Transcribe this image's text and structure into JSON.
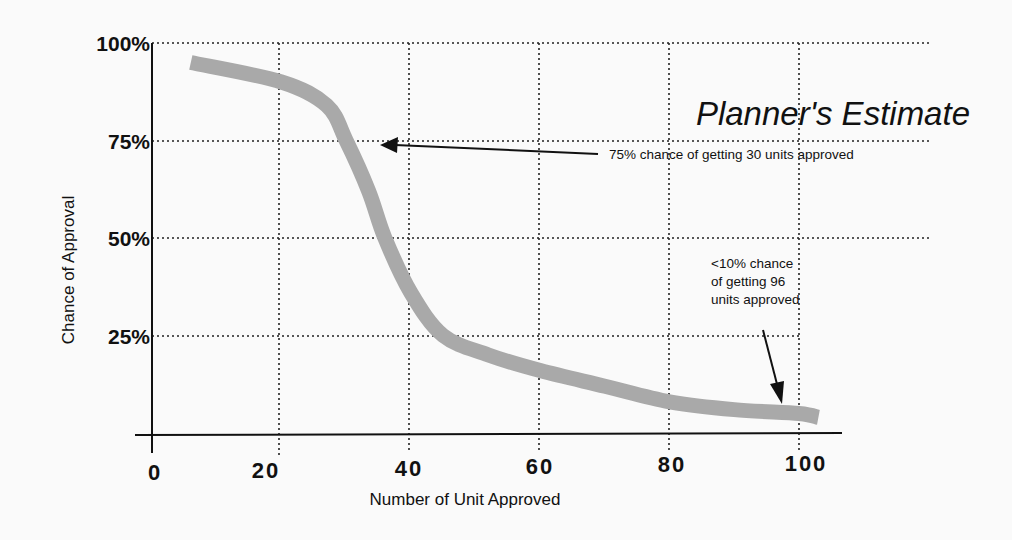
{
  "chart_data": {
    "type": "line",
    "title": "Planner's Estimate",
    "xlabel": "Number of Unit Approved",
    "ylabel": "Chance of Approval",
    "xlim": [
      0,
      100
    ],
    "ylim": [
      0,
      100
    ],
    "x_ticks": [
      0,
      20,
      40,
      60,
      80,
      100
    ],
    "x_tick_labels": [
      "0",
      "20",
      "40",
      "60",
      "80",
      "100"
    ],
    "y_ticks": [
      25,
      50,
      75,
      100
    ],
    "y_tick_labels": [
      "25%",
      "50%",
      "75%",
      "100%"
    ],
    "grid": true,
    "grid_style": "dotted",
    "legend": null,
    "series": [
      {
        "name": "Planner's Estimate",
        "color": "#a9a9a9",
        "x": [
          6,
          20,
          27,
          30,
          33.5,
          36,
          40,
          45,
          52,
          60,
          70,
          80,
          90,
          100,
          103
        ],
        "y": [
          95,
          90,
          84,
          75,
          62,
          50,
          36,
          25,
          20,
          16,
          12,
          8,
          6,
          5,
          4
        ]
      }
    ],
    "annotations": [
      {
        "text": "75% chance of getting 30 units approved",
        "point": [
          30,
          75
        ]
      },
      {
        "text": "<10% chance of getting 96 units approved",
        "point": [
          96,
          7
        ]
      }
    ]
  },
  "labels": {
    "title": "Planner's Estimate",
    "xlabel": "Number of Unit Approved",
    "ylabel": "Chance of Approval",
    "y_ticks": [
      "100%",
      "75%",
      "50%",
      "25%"
    ],
    "x_ticks": [
      "0",
      "20",
      "40",
      "60",
      "80",
      "100"
    ],
    "annotation_75": "75% chance of getting 30 units approved",
    "annotation_10_lines": [
      "<10% chance",
      "of getting 96",
      "units approved"
    ]
  },
  "colors": {
    "curve": "#a9a9a9",
    "ink": "#111111",
    "background": "#fafafa"
  }
}
